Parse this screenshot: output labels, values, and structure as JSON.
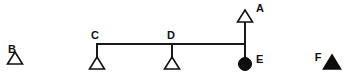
{
  "diagram": {
    "background_color": "#ffffff",
    "stroke_color": "#111111",
    "fill_color": "#0d0d0d",
    "nodes": [
      {
        "id": "B",
        "label": "B",
        "shape": "triangle",
        "fill": "open",
        "x": 15,
        "y": 64,
        "label_x": 12,
        "label_y": 53,
        "connected": false
      },
      {
        "id": "C",
        "label": "C",
        "shape": "triangle",
        "fill": "open",
        "x": 97,
        "y": 64,
        "label_x": 93,
        "label_y": 38,
        "connected": true
      },
      {
        "id": "D",
        "label": "D",
        "shape": "triangle",
        "fill": "open",
        "x": 172,
        "y": 64,
        "label_x": 168,
        "label_y": 38,
        "connected": true
      },
      {
        "id": "A",
        "label": "A",
        "shape": "triangle",
        "fill": "open",
        "x": 245,
        "y": 21,
        "label_x": 256,
        "label_y": 11,
        "connected": true
      },
      {
        "id": "E",
        "label": "E",
        "shape": "circle",
        "fill": "filled",
        "x": 245,
        "y": 64,
        "label_x": 256,
        "label_y": 62,
        "connected": true
      },
      {
        "id": "F",
        "label": "F",
        "shape": "triangle",
        "fill": "filled",
        "x": 332,
        "y": 64,
        "label_x": 318,
        "label_y": 60,
        "connected": false
      }
    ],
    "links": [
      {
        "id": "sibling-bar",
        "type": "horizontal",
        "x1": 97,
        "y1": 44,
        "x2": 245,
        "y2": 44
      },
      {
        "id": "drop-c",
        "type": "vertical",
        "x1": 97,
        "y1": 44,
        "x2": 97,
        "y2": 57
      },
      {
        "id": "drop-d",
        "type": "vertical",
        "x1": 172,
        "y1": 44,
        "x2": 172,
        "y2": 57
      },
      {
        "id": "stem-a-e",
        "type": "vertical",
        "x1": 245,
        "y1": 22,
        "x2": 245,
        "y2": 64
      }
    ],
    "geometry": {
      "triangle_half_width": 7.5,
      "triangle_height": 12,
      "circle_radius": 6.5
    }
  }
}
